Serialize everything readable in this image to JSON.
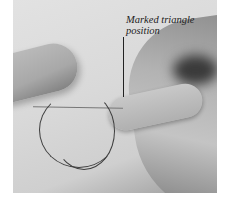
{
  "image": {
    "description": "Photograph of fingers holding a needle with a loop of dark thread on light fabric",
    "annotation": {
      "label": "Marked triangle position"
    }
  }
}
